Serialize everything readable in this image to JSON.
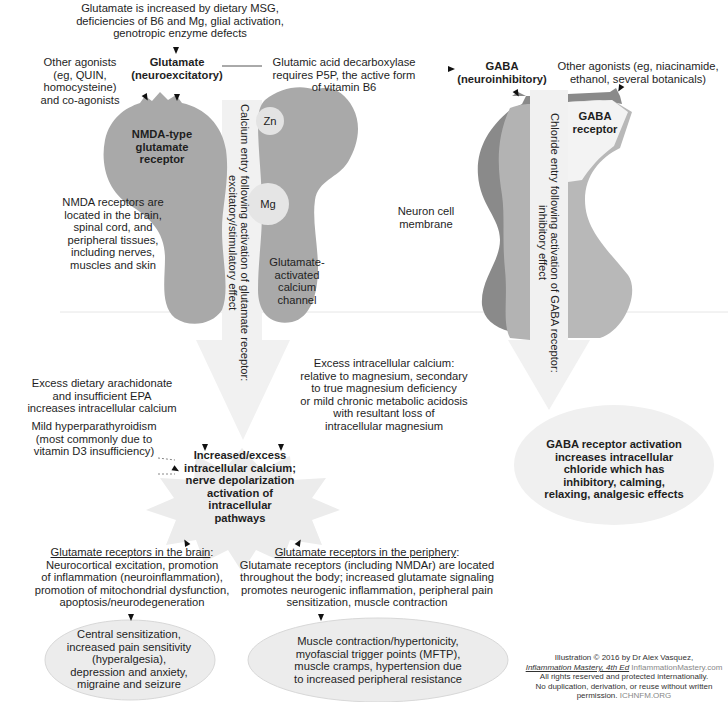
{
  "top": {
    "glutamate_causes": [
      "Glutamate is increased by dietary MSG,",
      "deficiencies of B6 and Mg, glial activation,",
      "genotropic enzyme defects"
    ],
    "glutamate_label": [
      "Glutamate",
      "(neuroexcitatory)"
    ],
    "other_agonists_left": [
      "Other agonists",
      "(eg, QUIN,",
      "homocysteine)",
      "and co-agonists"
    ],
    "gad_note": [
      "Glutamic acid decarboxylase",
      "requires P5P, the active form",
      "of vitamin B6"
    ],
    "gaba_label": [
      "GABA",
      "(neuroinhibitory)"
    ],
    "other_agonists_right": [
      "Other agonists (eg, niacinamide,",
      "ethanol, several botanicals)"
    ]
  },
  "receptors": {
    "nmda_label": [
      "NMDA-type",
      "glutamate",
      "receptor"
    ],
    "nmda_location": [
      "NMDA receptors are",
      "located in the brain,",
      "spinal cord, and",
      "peripheral tissues,",
      "including nerves,",
      "muscles and skin"
    ],
    "zn": "Zn",
    "mg": "Mg",
    "channel_label": [
      "Glutamate-",
      "activated",
      "calcium",
      "channel"
    ],
    "calcium_entry": [
      "Calcium entry following activation of glutamate receptor:",
      "excitatory/stimulatory effect"
    ],
    "membrane_label": [
      "Neuron cell",
      "membrane"
    ],
    "gaba_receptor_label": [
      "GABA",
      "receptor"
    ],
    "chloride_entry": [
      "Chloride entry following activation of GABA receptor:",
      "inhibitory effect"
    ]
  },
  "middle": {
    "excess_calcium_note": [
      "Excess intracellular calcium:",
      "relative to magnesium, secondary",
      "to true magnesium deficiency",
      "or mild chronic metabolic acidosis",
      "with resultant loss of",
      "intracellular magnesium"
    ],
    "arachidonate_note": [
      "Excess dietary arachidonate",
      "and insufficient EPA",
      "increases intracellular calcium"
    ],
    "hyperparathyroidism_note": [
      "Mild hyperparathyroidism",
      "(most commonly due to",
      "vitamin D3 insufficiency)"
    ],
    "burst": [
      "Increased/excess",
      "intracellular calcium;",
      "nerve depolarization",
      "activation of",
      "intracellular pathways"
    ],
    "gaba_effect": [
      "GABA receptor activation",
      "increases intracellular",
      "chloride which has",
      "inhibitory, calming,",
      "relaxing, analgesic effects"
    ]
  },
  "bottom": {
    "brain_heading": "Glutamate receptors in the brain",
    "brain_text": [
      "Neurocortical excitation, promotion",
      "of inflammation (neuroinflammation),",
      "promotion of mitochondrial dysfunction,",
      "apoptosis/neurodegeneration"
    ],
    "periphery_heading": "Glutamate receptors in the periphery",
    "periphery_text": [
      "Glutamate receptors (including NMDAr) are located",
      "throughout the body; increased glutamate signaling",
      "promotes neurogenic inflammation, peripheral pain",
      "sensitization, muscle contraction"
    ],
    "brain_outcome": [
      "Central sensitization,",
      "increased pain sensitivity",
      "(hyperalgesia),",
      "depression and anxiety,",
      "migraine and seizure"
    ],
    "periphery_outcome": [
      "Muscle contraction/hypertonicity,",
      "myofascial trigger points (MFTP),",
      "muscle cramps, hypertension due",
      "to increased peripheral resistance"
    ]
  },
  "credit": {
    "line1": "Illustration © 2016 by Dr Alex Vasquez,",
    "book": "Inflammation Mastery, 4th Ed",
    "site": "InflammationMastery.com",
    "line3": "All rights reserved and protected internationally.",
    "line4": "No duplication, derivation, or reuse without written",
    "line5a": "permission.",
    "line5b": "ICHNFM.ORG"
  },
  "colors": {
    "receptor_gray": "#a9a9a9",
    "gaba_dark": "#8a8a8a",
    "gaba_mid": "#b3b3b3",
    "arrow_fill": "#f0f0f0",
    "ion_circle": "#e3e3e3"
  }
}
